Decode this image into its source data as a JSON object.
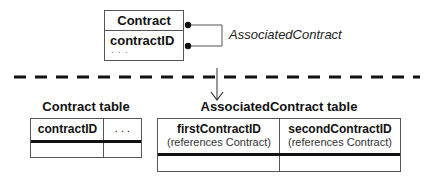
{
  "entity": {
    "name": "Contract",
    "attributes": [
      "contractID",
      ". . ."
    ]
  },
  "relationship": {
    "label": "AssociatedContract"
  },
  "tables": [
    {
      "title": "Contract table",
      "columns": [
        {
          "name": "contractID",
          "note": ""
        },
        {
          "name": ". . .",
          "note": ""
        }
      ]
    },
    {
      "title": "AssociatedContract table",
      "columns": [
        {
          "name": "firstContractID",
          "note": "(references Contract)"
        },
        {
          "name": "secondContractID",
          "note": "(references Contract)"
        }
      ]
    }
  ]
}
